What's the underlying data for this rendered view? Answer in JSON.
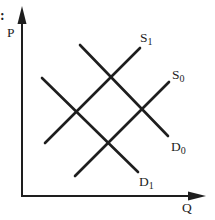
{
  "figure": {
    "background": "#ffffff",
    "ink": "#1e1e1e",
    "fragment": ":",
    "fragment_pos": {
      "x": 0,
      "y": 20
    },
    "axes": {
      "y_label": "P",
      "y_label_pos": {
        "x": 7,
        "y": 37
      },
      "x_label": "Q",
      "x_label_pos": {
        "x": 182,
        "y": 212
      },
      "origin": {
        "x": 22,
        "y": 196
      },
      "y_axis": {
        "x": 22,
        "y_start": 197,
        "y_end": 22,
        "arrow_tip_y": 6,
        "arrow_base_y": 24,
        "arrow_half_width": 4.5
      },
      "x_axis": {
        "y": 196,
        "x_start": 21,
        "x_end": 190,
        "arrow_tip_x": 206,
        "arrow_base_x": 188,
        "arrow_half_height": 4.5
      }
    },
    "curves": [
      {
        "id": "s1",
        "base": "S",
        "sub": "1",
        "x1": 45,
        "y1": 143,
        "x2": 140,
        "y2": 48,
        "label_pos": {
          "x": 140,
          "y": 42
        }
      },
      {
        "id": "s0",
        "base": "S",
        "sub": "0",
        "x1": 75,
        "y1": 176,
        "x2": 169,
        "y2": 82,
        "label_pos": {
          "x": 172,
          "y": 79
        }
      },
      {
        "id": "d0",
        "base": "D",
        "sub": "0",
        "x1": 80,
        "y1": 45,
        "x2": 168,
        "y2": 136,
        "label_pos": {
          "x": 171,
          "y": 151
        }
      },
      {
        "id": "d1",
        "base": "D",
        "sub": "1",
        "x1": 42,
        "y1": 78,
        "x2": 138,
        "y2": 172,
        "label_pos": {
          "x": 139,
          "y": 186
        }
      }
    ]
  }
}
